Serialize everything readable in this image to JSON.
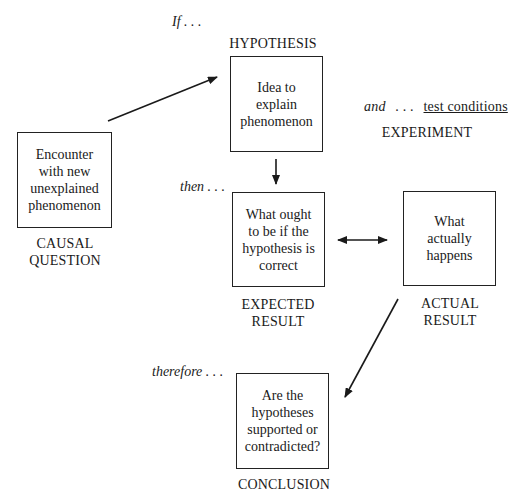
{
  "diagram": {
    "connectors": {
      "if": "If . . .",
      "then": "then . . .",
      "and": "and",
      "and_dots": ". . .",
      "test_conditions": "test conditions",
      "therefore": "therefore . . ."
    },
    "nodes": [
      {
        "id": "causal_question",
        "text": [
          "Encounter",
          "with new",
          "unexplained",
          "phenomenon"
        ],
        "label": [
          "CAUSAL",
          "QUESTION"
        ]
      },
      {
        "id": "hypothesis",
        "text": [
          "Idea to",
          "explain",
          "phenomenon"
        ],
        "label": [
          "HYPOTHESIS"
        ]
      },
      {
        "id": "experiment",
        "label": [
          "EXPERIMENT"
        ]
      },
      {
        "id": "expected_result",
        "text": [
          "What ought",
          "to be if the",
          "hypothesis is",
          "correct"
        ],
        "label": [
          "EXPECTED",
          "RESULT"
        ]
      },
      {
        "id": "actual_result",
        "text": [
          "What",
          "actually",
          "happens"
        ],
        "label": [
          "ACTUAL",
          "RESULT"
        ]
      },
      {
        "id": "conclusion",
        "text": [
          "Are the",
          "hypotheses",
          "supported or",
          "contradicted?"
        ],
        "label": [
          "CONCLUSION"
        ]
      }
    ],
    "edges": [
      {
        "from": "causal_question",
        "to": "hypothesis",
        "type": "arrow"
      },
      {
        "from": "hypothesis",
        "to": "expected_result",
        "type": "arrow"
      },
      {
        "from": "expected_result",
        "to": "actual_result",
        "type": "double-arrow"
      },
      {
        "from": "actual_result",
        "to": "conclusion",
        "type": "arrow"
      }
    ]
  }
}
